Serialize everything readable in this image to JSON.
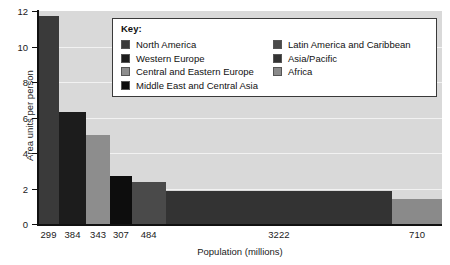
{
  "chart_data": {
    "type": "bar",
    "title": "",
    "xlabel": "Population (millions)",
    "ylabel": "Area units per person",
    "ylim": [
      0,
      12
    ],
    "yticks": [
      0,
      2,
      4,
      6,
      8,
      10,
      12
    ],
    "grid": true,
    "legend_position": "top-center",
    "legend_title": "Key:",
    "categories": [
      "North America",
      "Western Europe",
      "Central and Eastern Europe",
      "Middle East and Central Asia",
      "Latin America and Caribbean",
      "Asia/Pacific",
      "Africa"
    ],
    "xtick_labels": [
      "299",
      "384",
      "343",
      "307",
      "484",
      "3222",
      "710"
    ],
    "populations": [
      299,
      384,
      343,
      307,
      484,
      3222,
      710
    ],
    "values": [
      11.7,
      6.3,
      5.0,
      2.7,
      2.35,
      1.85,
      1.4
    ],
    "colors": [
      "#3a3a3a",
      "#1c1c1c",
      "#8d8d8d",
      "#0d0d0d",
      "#4a4a4a",
      "#333333",
      "#8a8a8a"
    ],
    "note": "Bar widths are proportional to population (millions)"
  },
  "legend": {
    "title": "Key:",
    "left_column": [
      {
        "label": "North America",
        "color": "#3a3a3a"
      },
      {
        "label": "Western Europe",
        "color": "#1c1c1c"
      },
      {
        "label": "Central and Eastern Europe",
        "color": "#8d8d8d"
      },
      {
        "label": "Middle East and Central Asia",
        "color": "#0d0d0d"
      }
    ],
    "right_column": [
      {
        "label": "Latin America and Caribbean",
        "color": "#4a4a4a"
      },
      {
        "label": "Asia/Pacific",
        "color": "#333333"
      },
      {
        "label": "Africa",
        "color": "#8a8a8a"
      }
    ]
  },
  "axes": {
    "y_title": "Area units per person",
    "x_title": "Population (millions)"
  }
}
